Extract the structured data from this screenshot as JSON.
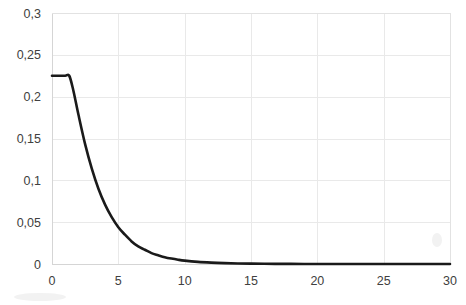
{
  "chart_data": {
    "type": "line",
    "title": "",
    "subtitle": "",
    "xlabel": "",
    "ylabel": "",
    "xlim": [
      0,
      30
    ],
    "ylim": [
      0,
      0.3
    ],
    "grid": true,
    "legend": false,
    "decimal_separator": ",",
    "series": [
      {
        "name": "decay-curve",
        "color": "#1a1a1a",
        "x": [
          0,
          0.5,
          1,
          1.3,
          1.6,
          2,
          2.5,
          3,
          3.5,
          4,
          4.5,
          5,
          5.5,
          6,
          6.5,
          7,
          7.5,
          8,
          8.5,
          9,
          9.5,
          10,
          11,
          12,
          13,
          14,
          15,
          16,
          17,
          18,
          19,
          20,
          22,
          24,
          26,
          28,
          30
        ],
        "y": [
          0.225,
          0.225,
          0.225,
          0.225,
          0.208,
          0.178,
          0.143,
          0.114,
          0.09,
          0.071,
          0.056,
          0.044,
          0.035,
          0.027,
          0.021,
          0.017,
          0.013,
          0.0105,
          0.0082,
          0.0065,
          0.0051,
          0.004,
          0.0025,
          0.0016,
          0.001,
          0.0006,
          0.0004,
          0.00025,
          0.00015,
          0.0001,
          6e-05,
          4e-05,
          2e-05,
          1e-05,
          5e-06,
          2e-06,
          1e-06
        ]
      }
    ],
    "x_ticks": [
      {
        "value": 0,
        "label": "0"
      },
      {
        "value": 5,
        "label": "5"
      },
      {
        "value": 10,
        "label": "10"
      },
      {
        "value": 15,
        "label": "15"
      },
      {
        "value": 20,
        "label": "20"
      },
      {
        "value": 25,
        "label": "25"
      },
      {
        "value": 30,
        "label": "30"
      }
    ],
    "y_ticks": [
      {
        "value": 0,
        "label": "0"
      },
      {
        "value": 0.05,
        "label": "0,05"
      },
      {
        "value": 0.1,
        "label": "0,1"
      },
      {
        "value": 0.15,
        "label": "0,15"
      },
      {
        "value": 0.2,
        "label": "0,2"
      },
      {
        "value": 0.25,
        "label": "0,25"
      },
      {
        "value": 0.3,
        "label": "0,3"
      }
    ],
    "colors": {
      "series": "#1a1a1a",
      "grid": "#e9e9e9",
      "axis": "#d5d5d5",
      "text": "#404040",
      "background": "#ffffff"
    }
  }
}
